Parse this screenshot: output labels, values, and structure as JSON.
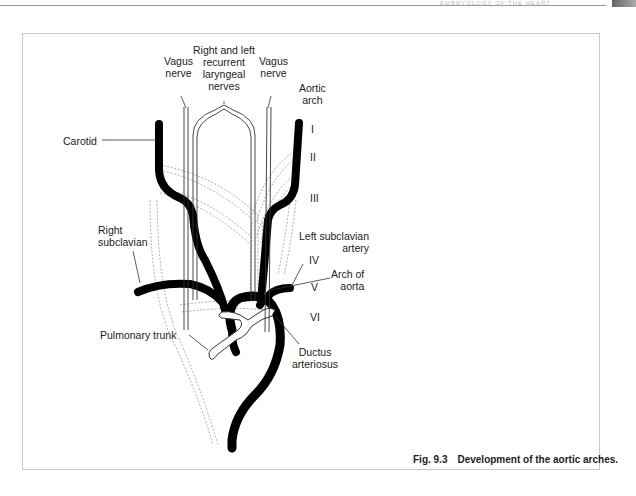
{
  "page": {
    "running_header": "EMBRYOLOGY OF THE HEART"
  },
  "figure": {
    "number": "Fig. 9.3",
    "caption": "Development of the aortic arches.",
    "labels": {
      "vagus_left_line1": "Vagus",
      "vagus_left_line2": "nerve",
      "recurrent_line1": "Right and left",
      "recurrent_line2": "recurrent",
      "recurrent_line3": "laryngeal",
      "recurrent_line4": "nerves",
      "vagus_right_line1": "Vagus",
      "vagus_right_line2": "nerve",
      "aortic_arch_line1": "Aortic",
      "aortic_arch_line2": "arch",
      "carotid": "Carotid",
      "right_subclavian_line1": "Right",
      "right_subclavian_line2": "subclavian",
      "left_subclavian_line1": "Left subclavian",
      "left_subclavian_line2": "artery",
      "arch_of_aorta_line1": "Arch of",
      "arch_of_aorta_line2": "aorta",
      "pulmonary_trunk": "Pulmonary trunk",
      "ductus_line1": "Ductus",
      "ductus_line2": "arteriosus"
    },
    "arch_numerals": [
      "I",
      "II",
      "III",
      "IV",
      "V",
      "VI"
    ],
    "colors": {
      "vessel": "#000000",
      "outline": "#333333",
      "dashed": "#888888",
      "frame": "#c8c8c8"
    }
  }
}
